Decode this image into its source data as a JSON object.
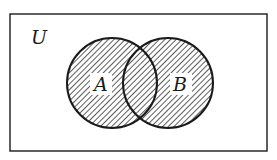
{
  "diagram": {
    "type": "venn",
    "universe_label": "U",
    "sets": [
      {
        "label": "A",
        "shaded": true
      },
      {
        "label": "B",
        "shaded": true
      }
    ],
    "shaded_region": "A ∪ B",
    "colors": {
      "stroke": "#1a1a1a",
      "hatch": "#333333",
      "background": "#ffffff"
    }
  }
}
